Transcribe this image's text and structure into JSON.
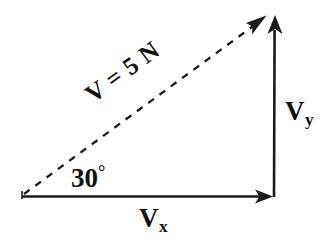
{
  "figure": {
    "background_color": "#ffffff",
    "stroke_color": "#1a1a1a",
    "vectors": [
      {
        "name": "resultant",
        "label": "V = 5 N",
        "magnitude": 5,
        "unit": "N",
        "style": "dashed",
        "direction": "up-right",
        "start": [
          24,
          194
        ],
        "end": [
          266,
          16
        ],
        "arrowhead": true
      },
      {
        "name": "horizontal-component",
        "label": "V",
        "subscript": "x",
        "style": "solid",
        "direction": "right",
        "start": [
          22,
          196
        ],
        "end": [
          273,
          196
        ],
        "arrowhead": true
      },
      {
        "name": "vertical-component",
        "label": "V",
        "subscript": "y",
        "style": "solid",
        "direction": "up",
        "start": [
          273,
          196
        ],
        "end": [
          275,
          17
        ],
        "arrowhead": true
      }
    ],
    "angle": {
      "value": "30",
      "unit_symbol": "°",
      "label": "30°",
      "between": [
        "horizontal-component",
        "resultant"
      ]
    },
    "labels": {
      "hypotenuse": "V = 5 N",
      "angle": "30",
      "angle_symbol": "°",
      "vy_base": "V",
      "vy_sub": "y",
      "vx_base": "V",
      "vx_sub": "x"
    }
  }
}
